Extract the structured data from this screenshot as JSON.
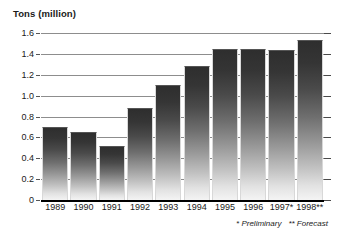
{
  "chart_data": {
    "type": "bar",
    "title": "Tons (million)",
    "xlabel": "",
    "ylabel": "Tons (million)",
    "categories": [
      "1989",
      "1990",
      "1991",
      "1992",
      "1993",
      "1994",
      "1995",
      "1996",
      "1997*",
      "1998**"
    ],
    "values": [
      0.7,
      0.65,
      0.52,
      0.88,
      1.1,
      1.28,
      1.45,
      1.45,
      1.44,
      1.53
    ],
    "ylim": [
      0,
      1.6
    ],
    "ytick_labels": [
      "0",
      "0.2",
      "0.4",
      "0.6",
      "0.8",
      "1.0",
      "1.2",
      "1.4",
      "1.6"
    ],
    "ytick_values": [
      0,
      0.2,
      0.4,
      0.6,
      0.8,
      1.0,
      1.2,
      1.4,
      1.6
    ],
    "grid": true,
    "legend": null,
    "annotations": [
      "* Preliminary",
      "** Forecast"
    ],
    "bar_color_top": "#2e2e2e",
    "bar_color_bottom": "#f4f4f4",
    "gridline_color": "#8d8d8d",
    "axis_color": "#000000"
  },
  "footnotes": {
    "preliminary": "* Preliminary",
    "forecast": "** Forecast"
  }
}
